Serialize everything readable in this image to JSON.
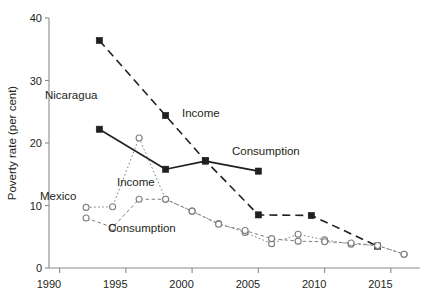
{
  "chart_data": {
    "type": "line",
    "title": "",
    "subtitle": "",
    "xlabel": "",
    "ylabel": "Poverty rate (per cent)",
    "xlim": [
      1989.2,
      2017.2
    ],
    "ylim": [
      0,
      40
    ],
    "xticks": [
      1990,
      1995,
      2000,
      2005,
      2010,
      2015
    ],
    "xticklabels": [
      "1990",
      "1995",
      "2000",
      "2005",
      "2010",
      "2015"
    ],
    "yticks": [
      0,
      10,
      20,
      30,
      40
    ],
    "yticklabels": [
      "0",
      "10",
      "20",
      "30",
      "40"
    ],
    "grid": false,
    "legend": "inline-annotations",
    "series": [
      {
        "name": "Nicaragua Income",
        "country": "Nicaragua",
        "measure": "Income",
        "linestyle": "dashed",
        "marker": "filled-square",
        "color": "#231f20",
        "x": [
          1993,
          1998,
          2001,
          2005,
          2009,
          2014
        ],
        "y": [
          36.4,
          24.4,
          17.2,
          8.5,
          8.4,
          3.5
        ]
      },
      {
        "name": "Nicaragua Consumption",
        "country": "Nicaragua",
        "measure": "Consumption",
        "linestyle": "solid",
        "marker": "filled-square",
        "color": "#231f20",
        "x": [
          1993,
          1998,
          2001,
          2005
        ],
        "y": [
          22.2,
          15.8,
          17.1,
          15.5
        ]
      },
      {
        "name": "Mexico Income",
        "country": "Mexico",
        "measure": "Income",
        "linestyle": "dotted",
        "marker": "open-circle",
        "color": "#7f7f7f",
        "x": [
          1992,
          1994,
          1996,
          1998,
          2000,
          2002,
          2004,
          2006,
          2008,
          2010,
          2012,
          2014,
          2016
        ],
        "y": [
          9.7,
          9.8,
          20.8,
          11.0,
          9.1,
          7.1,
          5.7,
          3.9,
          5.4,
          4.5,
          3.8,
          3.6,
          2.2
        ]
      },
      {
        "name": "Mexico Consumption",
        "country": "Mexico",
        "measure": "Consumption",
        "linestyle": "dashed-fine",
        "marker": "open-circle",
        "color": "#7f7f7f",
        "x": [
          1992,
          1994,
          1996,
          1998,
          2000,
          2002,
          2004,
          2006,
          2008,
          2010,
          2012,
          2014,
          2016
        ],
        "y": [
          8.0,
          6.5,
          11.0,
          11.0,
          9.1,
          7.0,
          6.0,
          4.7,
          4.3,
          4.2,
          4.0,
          3.6,
          2.2
        ]
      }
    ],
    "annotations": [
      {
        "id": "nicaragua-label",
        "text": "Nicaragua",
        "x_px": 45,
        "y_px": 99
      },
      {
        "id": "nicaragua-income-label",
        "text": "Income",
        "x_px": 182,
        "y_px": 117
      },
      {
        "id": "nicaragua-consumption-label",
        "text": "Consumption",
        "x_px": 232,
        "y_px": 155
      },
      {
        "id": "mexico-label",
        "text": "Mexico",
        "x_px": 40,
        "y_px": 200
      },
      {
        "id": "mexico-income-label",
        "text": "Income",
        "x_px": 117,
        "y_px": 186
      },
      {
        "id": "mexico-consumption-label",
        "text": "Consumption",
        "x_px": 108,
        "y_px": 232
      }
    ]
  },
  "axes": {
    "y_title": "Poverty rate (per cent)",
    "tick_0": "0",
    "tick_10": "10",
    "tick_20": "20",
    "tick_30": "30",
    "tick_40": "40",
    "x_1990": "1990",
    "x_1995": "1995",
    "x_2000": "2000",
    "x_2005": "2005",
    "x_2010": "2010",
    "x_2015": "2015"
  },
  "labels": {
    "nicaragua": "Nicaragua",
    "nicaragua_income": "Income",
    "nicaragua_consumption": "Consumption",
    "mexico": "Mexico",
    "mexico_income": "Income",
    "mexico_consumption": "Consumption"
  },
  "colors": {
    "ink": "#231f20",
    "grey": "#7f7f7f",
    "axis": "#8a8a8a",
    "background": "#ffffff"
  }
}
